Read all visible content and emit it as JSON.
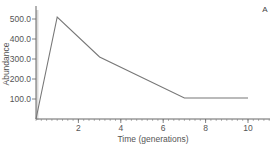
{
  "chart_data": {
    "type": "line",
    "title": "",
    "panel_label": "A",
    "xlabel": "Time (generations)",
    "ylabel": "Abundance",
    "xlim": [
      0,
      11
    ],
    "ylim": [
      0,
      560
    ],
    "x_ticks": [
      2,
      4,
      6,
      8,
      10
    ],
    "x_tick_labels": [
      "2",
      "4",
      "6",
      "8",
      "10"
    ],
    "y_ticks": [
      100,
      200,
      300,
      400,
      500
    ],
    "y_tick_labels": [
      "100.0",
      "200.0",
      "300.0",
      "400.0",
      "500.0"
    ],
    "grid": false,
    "legend": null,
    "series": [
      {
        "name": "Abundance",
        "color": "#777777",
        "x": [
          0,
          1,
          3,
          7,
          10
        ],
        "y": [
          0,
          510,
          310,
          105,
          105
        ]
      }
    ]
  }
}
